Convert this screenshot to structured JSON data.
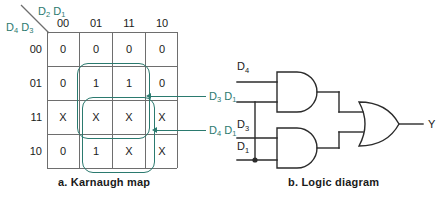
{
  "figure": {
    "title_a": "a.  Karnaugh map",
    "title_b": "b.  Logic diagram",
    "accent_color": "#2b7a6f",
    "line_color": "#6e6e6e",
    "text_color": "#1a1a1a"
  },
  "kmap": {
    "col_axis_label": "D2 D1",
    "row_axis_label": "D4 D3",
    "col_headers": [
      "00",
      "01",
      "11",
      "10"
    ],
    "row_headers": [
      "00",
      "01",
      "11",
      "10"
    ],
    "cells": [
      [
        "0",
        "0",
        "0",
        "0"
      ],
      [
        "0",
        "1",
        "1",
        "0"
      ],
      [
        "X",
        "X",
        "X",
        "X"
      ],
      [
        "0",
        "1",
        "X",
        "X"
      ]
    ],
    "groups": [
      {
        "name": "D3 D1",
        "label": "D3 D1",
        "rows": [
          1,
          2
        ],
        "cols": [
          1,
          2
        ]
      },
      {
        "name": "D4 D1",
        "label": "D4 D1",
        "rows": [
          2,
          3
        ],
        "cols": [
          1,
          2
        ]
      }
    ]
  },
  "logic": {
    "inputs": [
      "D4",
      "D3",
      "D1"
    ],
    "output": "Y",
    "gates": [
      {
        "type": "AND",
        "name": "and-gate-top",
        "inputs": [
          "D4",
          "D1"
        ]
      },
      {
        "type": "AND",
        "name": "and-gate-bottom",
        "inputs": [
          "D3",
          "D1"
        ]
      },
      {
        "type": "OR",
        "name": "or-gate",
        "inputs": [
          "and-gate-top",
          "and-gate-bottom"
        ],
        "output": "Y"
      }
    ]
  }
}
